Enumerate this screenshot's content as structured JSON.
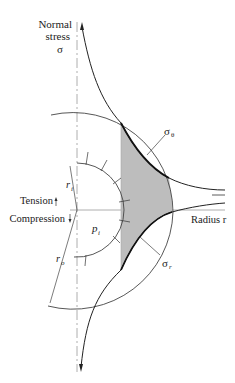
{
  "diagram": {
    "axis_y_label_line1": "Normal",
    "axis_y_label_line2": "stress",
    "axis_y_symbol": "σ",
    "axis_x_label": "Radius r",
    "tension_label": "Tension",
    "compression_label": "Compression",
    "inner_radius_label": "r",
    "inner_radius_sub": "i",
    "outer_radius_label": "r",
    "outer_radius_sub": "o",
    "pressure_label": "p",
    "pressure_sub": "i",
    "hoop_stress_label": "σ",
    "hoop_stress_sub": "θ",
    "radial_stress_label": "σ",
    "radial_stress_sub": "r",
    "colors": {
      "line": "#333333",
      "shade": "#bdbdbd",
      "axis": "#9a9a9a"
    }
  }
}
